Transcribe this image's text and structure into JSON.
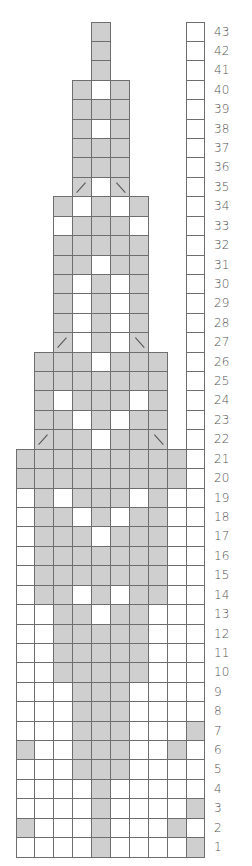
{
  "chart_data": {
    "type": "table",
    "title": "",
    "legend": {
      "G": "gray",
      "W": "white",
      ".": "none",
      "L": "gray-left-slant",
      "R": "gray-right-slant"
    },
    "colors": {
      "gray": "#cfcfcf",
      "white": "#ffffff",
      "border": "#6e6e6e",
      "label": "#555555"
    },
    "columns": 10,
    "rows_top_to_bottom": [
      {
        "n": 43,
        "cells": "....G....W"
      },
      {
        "n": 42,
        "cells": "....G....W"
      },
      {
        "n": 41,
        "cells": "....G....W"
      },
      {
        "n": 40,
        "cells": "...GWG...W"
      },
      {
        "n": 39,
        "cells": "...GGG...W"
      },
      {
        "n": 38,
        "cells": "...GWG...W"
      },
      {
        "n": 37,
        "cells": "...GGG...W"
      },
      {
        "n": 36,
        "cells": "...GGG...W"
      },
      {
        "n": 35,
        "cells": "...LWR...W"
      },
      {
        "n": 34,
        "cells": "..GWGWG..W"
      },
      {
        "n": 33,
        "cells": "..WGGGW..W"
      },
      {
        "n": 32,
        "cells": "..GGGGG..W"
      },
      {
        "n": 31,
        "cells": "..GGWGG..W"
      },
      {
        "n": 30,
        "cells": "..GWGWG..W"
      },
      {
        "n": 29,
        "cells": "..GWGWG..W"
      },
      {
        "n": 28,
        "cells": "..GWGWG..W"
      },
      {
        "n": 27,
        "cells": "..LWGWR..W"
      },
      {
        "n": 26,
        "cells": ".GGGWGGG.W"
      },
      {
        "n": 25,
        "cells": ".GGGGGGG.W"
      },
      {
        "n": 24,
        "cells": ".GWGGGWG.W"
      },
      {
        "n": 23,
        "cells": ".GGWGWGG.W"
      },
      {
        "n": 22,
        "cells": ".LGGWGGR.W"
      },
      {
        "n": 21,
        "cells": "GGGGGGGGGW"
      },
      {
        "n": 20,
        "cells": "GGGGGGGGGW"
      },
      {
        "n": 19,
        "cells": "WGWGGGWGWW"
      },
      {
        "n": 18,
        "cells": "WGGWGWGGWW"
      },
      {
        "n": 17,
        "cells": "WGGGWGGGWW"
      },
      {
        "n": 16,
        "cells": "WGGGGGGGWW"
      },
      {
        "n": 15,
        "cells": "WGGGGGGGWW"
      },
      {
        "n": 14,
        "cells": "WGGWGWGGWW"
      },
      {
        "n": 13,
        "cells": "WWGGWGGWWW"
      },
      {
        "n": 12,
        "cells": "WWGGGGGWWW"
      },
      {
        "n": 11,
        "cells": "WWGGGGGWWW"
      },
      {
        "n": 10,
        "cells": "WWGGGGGWWW"
      },
      {
        "n": 9,
        "cells": "WWWGGGWWWW"
      },
      {
        "n": 8,
        "cells": "WWWGGGWWWW"
      },
      {
        "n": 7,
        "cells": "WWWGGGWWWG"
      },
      {
        "n": 6,
        "cells": "GWWGGGWWGW"
      },
      {
        "n": 5,
        "cells": "WWWGGGWWWW"
      },
      {
        "n": 4,
        "cells": "WWWWGWWWWW"
      },
      {
        "n": 3,
        "cells": "WWWWGWWWWG"
      },
      {
        "n": 2,
        "cells": "GWWWGWWWGW"
      },
      {
        "n": 1,
        "cells": "WWWWGWWWWG"
      }
    ],
    "row_labels": [
      "43",
      "42",
      "41",
      "40",
      "39",
      "38",
      "37",
      "36",
      "35",
      "34",
      "33",
      "32",
      "31",
      "30",
      "29",
      "28",
      "27",
      "26",
      "25",
      "24",
      "23",
      "22",
      "21",
      "20",
      "19",
      "18",
      "17",
      "16",
      "15",
      "14",
      "13",
      "12",
      "11",
      "10",
      "9",
      "8",
      "7",
      "6",
      "5",
      "4",
      "3",
      "2",
      "1"
    ],
    "layout": {
      "grid_left": 16,
      "grid_top": 22,
      "cell_w": 18.9,
      "cell_h": 19.42,
      "label_x": 214
    }
  }
}
